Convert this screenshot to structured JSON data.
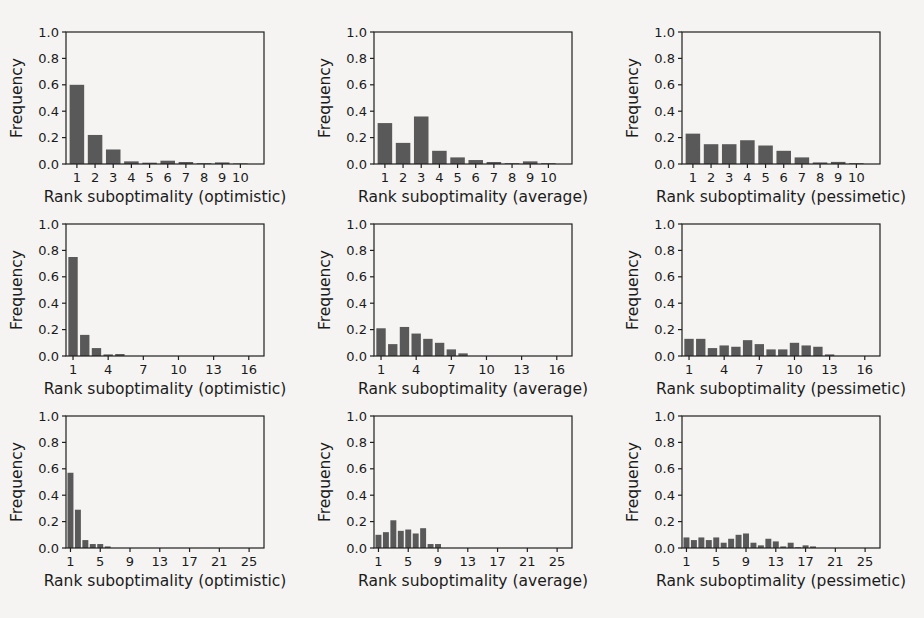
{
  "figure": {
    "background": "#f5f4f2"
  },
  "colors": {
    "bar": "#595959",
    "axis": "#1f1f1f",
    "text": "#1b1b1b"
  },
  "chart_data": [
    {
      "type": "bar",
      "row": 1,
      "col": 1,
      "title": "",
      "xlabel": "Rank suboptimality (optimistic)",
      "ylabel": "Frequency",
      "x_start": 1,
      "values": [
        0.6,
        0.22,
        0.11,
        0.02,
        0.01,
        0.025,
        0.015,
        0.006,
        0.012,
        0.004
      ],
      "xticks": [
        1,
        2,
        3,
        4,
        5,
        6,
        7,
        8,
        9,
        10
      ],
      "xlim": [
        0.4,
        11.3
      ],
      "ylim": [
        0,
        1.0
      ],
      "yticks": [
        0.0,
        0.2,
        0.4,
        0.6,
        0.8,
        1.0
      ],
      "grid": false,
      "legend": null
    },
    {
      "type": "bar",
      "row": 1,
      "col": 2,
      "title": "",
      "xlabel": "Rank suboptimality (average)",
      "ylabel": "Frequency",
      "x_start": 1,
      "values": [
        0.31,
        0.16,
        0.36,
        0.1,
        0.05,
        0.03,
        0.015,
        0.006,
        0.02,
        0.006
      ],
      "xticks": [
        1,
        2,
        3,
        4,
        5,
        6,
        7,
        8,
        9,
        10
      ],
      "xlim": [
        0.4,
        11.3
      ],
      "ylim": [
        0,
        1.0
      ],
      "yticks": [
        0.0,
        0.2,
        0.4,
        0.6,
        0.8,
        1.0
      ],
      "grid": false,
      "legend": null
    },
    {
      "type": "bar",
      "row": 1,
      "col": 3,
      "title": "",
      "xlabel": "Rank suboptimality (pessimetic)",
      "ylabel": "Frequency",
      "x_start": 1,
      "values": [
        0.23,
        0.15,
        0.15,
        0.18,
        0.14,
        0.1,
        0.05,
        0.012,
        0.016,
        0.006
      ],
      "xticks": [
        1,
        2,
        3,
        4,
        5,
        6,
        7,
        8,
        9,
        10
      ],
      "xlim": [
        0.4,
        11.3
      ],
      "ylim": [
        0,
        1.0
      ],
      "yticks": [
        0.0,
        0.2,
        0.4,
        0.6,
        0.8,
        1.0
      ],
      "grid": false,
      "legend": null
    },
    {
      "type": "bar",
      "row": 2,
      "col": 1,
      "title": "",
      "xlabel": "Rank suboptimality (optimistic)",
      "ylabel": "Frequency",
      "x_start": 1,
      "values": [
        0.75,
        0.16,
        0.06,
        0.012,
        0.015,
        0,
        0,
        0,
        0,
        0,
        0,
        0,
        0,
        0,
        0,
        0
      ],
      "xticks": [
        1,
        4,
        7,
        10,
        13,
        16
      ],
      "xlim": [
        0.4,
        17.3
      ],
      "ylim": [
        0,
        1.0
      ],
      "yticks": [
        0.0,
        0.2,
        0.4,
        0.6,
        0.8,
        1.0
      ],
      "grid": false,
      "legend": null
    },
    {
      "type": "bar",
      "row": 2,
      "col": 2,
      "title": "",
      "xlabel": "Rank suboptimality (average)",
      "ylabel": "Frequency",
      "x_start": 1,
      "values": [
        0.21,
        0.09,
        0.22,
        0.17,
        0.13,
        0.1,
        0.05,
        0.02,
        0,
        0,
        0,
        0,
        0,
        0,
        0,
        0
      ],
      "xticks": [
        1,
        4,
        7,
        10,
        13,
        16
      ],
      "xlim": [
        0.4,
        17.3
      ],
      "ylim": [
        0,
        1.0
      ],
      "yticks": [
        0.0,
        0.2,
        0.4,
        0.6,
        0.8,
        1.0
      ],
      "grid": false,
      "legend": null
    },
    {
      "type": "bar",
      "row": 2,
      "col": 3,
      "title": "",
      "xlabel": "Rank suboptimality (pessimetic)",
      "ylabel": "Frequency",
      "x_start": 1,
      "values": [
        0.13,
        0.13,
        0.06,
        0.08,
        0.07,
        0.12,
        0.09,
        0.05,
        0.05,
        0.1,
        0.08,
        0.07,
        0.012,
        0,
        0,
        0
      ],
      "xticks": [
        1,
        4,
        7,
        10,
        13,
        16
      ],
      "xlim": [
        0.4,
        17.3
      ],
      "ylim": [
        0,
        1.0
      ],
      "yticks": [
        0.0,
        0.2,
        0.4,
        0.6,
        0.8,
        1.0
      ],
      "grid": false,
      "legend": null
    },
    {
      "type": "bar",
      "row": 3,
      "col": 1,
      "title": "",
      "xlabel": "Rank suboptimality (optimistic)",
      "ylabel": "Frequency",
      "x_start": 1,
      "values": [
        0.57,
        0.29,
        0.06,
        0.03,
        0.03,
        0.012,
        0,
        0,
        0,
        0,
        0,
        0,
        0,
        0,
        0,
        0,
        0,
        0,
        0,
        0,
        0,
        0,
        0,
        0,
        0,
        0
      ],
      "xticks": [
        1,
        5,
        9,
        13,
        17,
        21,
        25
      ],
      "xlim": [
        0.4,
        27.0
      ],
      "ylim": [
        0,
        1.0
      ],
      "yticks": [
        0.0,
        0.2,
        0.4,
        0.6,
        0.8,
        1.0
      ],
      "grid": false,
      "legend": null
    },
    {
      "type": "bar",
      "row": 3,
      "col": 2,
      "title": "",
      "xlabel": "Rank suboptimality (average)",
      "ylabel": "Frequency",
      "x_start": 1,
      "values": [
        0.1,
        0.12,
        0.21,
        0.13,
        0.14,
        0.11,
        0.15,
        0.03,
        0.03,
        0,
        0,
        0,
        0,
        0,
        0,
        0,
        0,
        0,
        0,
        0,
        0,
        0,
        0,
        0,
        0,
        0
      ],
      "xticks": [
        1,
        5,
        9,
        13,
        17,
        21,
        25
      ],
      "xlim": [
        0.4,
        27.0
      ],
      "ylim": [
        0,
        1.0
      ],
      "yticks": [
        0.0,
        0.2,
        0.4,
        0.6,
        0.8,
        1.0
      ],
      "grid": false,
      "legend": null
    },
    {
      "type": "bar",
      "row": 3,
      "col": 3,
      "title": "",
      "xlabel": "Rank suboptimality (pessimetic)",
      "ylabel": "Frequency",
      "x_start": 1,
      "values": [
        0.08,
        0.06,
        0.08,
        0.06,
        0.08,
        0.04,
        0.07,
        0.1,
        0.11,
        0.04,
        0.02,
        0.07,
        0.05,
        0.012,
        0.04,
        0.006,
        0.02,
        0.012,
        0,
        0,
        0,
        0,
        0,
        0,
        0,
        0
      ],
      "xticks": [
        1,
        5,
        9,
        13,
        17,
        21,
        25
      ],
      "xlim": [
        0.4,
        27.0
      ],
      "ylim": [
        0,
        1.0
      ],
      "yticks": [
        0.0,
        0.2,
        0.4,
        0.6,
        0.8,
        1.0
      ],
      "grid": false,
      "legend": null
    }
  ]
}
